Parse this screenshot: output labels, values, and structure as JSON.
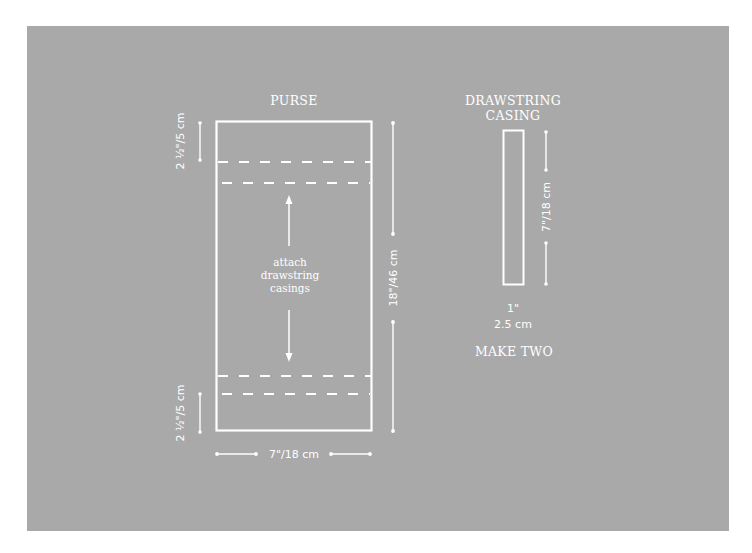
{
  "colors": {
    "background_outer": "#ffffff",
    "panel": "#a9a9a9",
    "lines_and_text": "#ffffff"
  },
  "purse": {
    "title": "PURSE",
    "center_label": [
      "attach",
      "drawstring",
      "casings"
    ],
    "dimension_top_hem": "2 ½\"/5 cm",
    "dimension_bottom_hem": "2 ½\"/5 cm",
    "dimension_height": "18\"/46 cm",
    "dimension_width": "7\"/18 cm"
  },
  "casing": {
    "title_line1": "DRAWSTRING",
    "title_line2": "CASING",
    "dimension_length": "7\"/18 cm",
    "dimension_width_imperial": "1\"",
    "dimension_width_metric": "2.5 cm",
    "quantity_note": "MAKE TWO"
  }
}
